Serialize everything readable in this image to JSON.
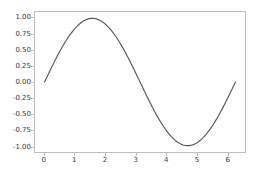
{
  "figure": {
    "background_color": "#ffffff",
    "axes_frame_color": "#bdbdbd",
    "tick_label_color": "#3a3a3a"
  },
  "chart_data": {
    "type": "line",
    "title": "",
    "subtitle": "",
    "xlabel": "",
    "ylabel": "",
    "grid": false,
    "legend": null,
    "legend_position": "none",
    "line_color": "#5a5a5a",
    "line_width": 1.2,
    "xlim": [
      -0.314,
      6.597
    ],
    "ylim": [
      -1.1,
      1.1
    ],
    "xticks": [
      0,
      1,
      2,
      3,
      4,
      5,
      6
    ],
    "xtick_labels": [
      "0",
      "1",
      "2",
      "3",
      "4",
      "5",
      "6"
    ],
    "yticks": [
      1.0,
      0.75,
      0.5,
      0.25,
      0.0,
      -0.25,
      -0.5,
      -0.75,
      -1.0
    ],
    "ytick_labels": [
      "1.00",
      "0.75",
      "0.50",
      "0.25",
      "0.00",
      "-0.25",
      "-0.50",
      "-0.75",
      "-1.00"
    ],
    "series": [
      {
        "name": "sin(x)",
        "function": "sin",
        "x_start": 0,
        "x_end": 6.283185307179586,
        "num_points": 200,
        "x": [
          0.0,
          0.314,
          0.628,
          0.942,
          1.257,
          1.571,
          1.885,
          2.199,
          2.513,
          2.827,
          3.142,
          3.456,
          3.77,
          4.084,
          4.398,
          4.712,
          5.027,
          5.341,
          5.655,
          5.969,
          6.283
        ],
        "values": [
          0.0,
          0.309,
          0.588,
          0.809,
          0.951,
          1.0,
          0.951,
          0.809,
          0.588,
          0.309,
          0.0,
          -0.309,
          -0.588,
          -0.809,
          -0.951,
          -1.0,
          -0.951,
          -0.809,
          -0.588,
          -0.309,
          0.0
        ]
      }
    ]
  }
}
